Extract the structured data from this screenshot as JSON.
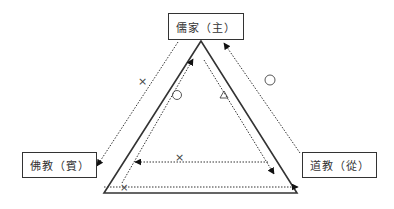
{
  "diagram": {
    "nodes": {
      "top": {
        "label": "儒家（主）"
      },
      "left": {
        "label": "佛教（賓）"
      },
      "right": {
        "label": "道教（從）"
      }
    },
    "symbols": {
      "left_outer": "×",
      "right_outer": "○",
      "left_inner": "○",
      "right_inner": "△",
      "bottom_inner": "×",
      "bottom_corner": "×"
    },
    "colors": {
      "line": "#333333",
      "background": "#ffffff"
    }
  }
}
